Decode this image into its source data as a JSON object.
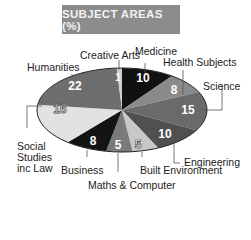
{
  "chart_data": {
    "type": "pie",
    "title": "SUBJECT AREAS (%)",
    "categories": [
      "Medicine",
      "Health Subjects",
      "Science",
      "Engineering",
      "Built Environment",
      "Maths & Computer",
      "Business",
      "Social Studies inc Law",
      "Humanities",
      "Creative Arts"
    ],
    "values": [
      10,
      8,
      15,
      10,
      5,
      5,
      8,
      16,
      22,
      1
    ],
    "colors": [
      "#111111",
      "#8a8a8a",
      "#6a6a6a",
      "#505050",
      "#c8c8c8",
      "#7a7a7a",
      "#141414",
      "#e2e2e2",
      "#6e6e6e",
      "#cfcfcf"
    ],
    "start_angle": "12 o'clock, clockwise",
    "legend": "none (leader-line labels)",
    "unit": "%"
  },
  "title": "SUBJECT AREAS (%)",
  "labels": {
    "medicine": "Medicine",
    "health": "Health Subjects",
    "science": "Science",
    "engineering": "Engineering",
    "built": "Built Environment",
    "maths": "Maths & Computer",
    "business": "Business",
    "social_1": "Social",
    "social_2": "Studies",
    "social_3": "inc Law",
    "humanities": "Humanities",
    "creative": "Creative Arts"
  },
  "values": {
    "medicine": "10",
    "health": "8",
    "science": "15",
    "engineering": "10",
    "built": "5",
    "maths": "5",
    "business": "8",
    "social": "16",
    "humanities": "22",
    "creative": "1"
  }
}
